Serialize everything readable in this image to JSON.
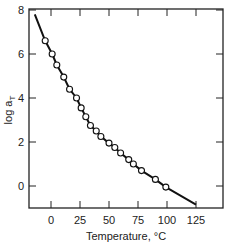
{
  "chart_data": {
    "type": "line",
    "title": "",
    "xlabel": "Temperature, °C",
    "ylabel": "log a",
    "ylabel_subscript": "T",
    "xlim": [
      -19,
      148
    ],
    "ylim": [
      -1,
      8
    ],
    "xticks": [
      0,
      25,
      50,
      75,
      100,
      125
    ],
    "yticks": [
      0,
      2,
      4,
      6,
      8
    ],
    "grid": false,
    "legend": null,
    "series": [
      {
        "name": "fitted curve",
        "style": "solid line",
        "x": [
          -14,
          -5,
          1,
          5,
          11,
          16,
          22,
          26,
          30,
          34,
          39,
          43,
          50,
          55,
          60,
          67,
          71,
          78,
          90,
          99,
          125
        ],
        "y": [
          7.8,
          6.6,
          6.0,
          5.5,
          4.95,
          4.4,
          4.0,
          3.55,
          3.15,
          2.75,
          2.5,
          2.25,
          1.95,
          1.75,
          1.5,
          1.2,
          1.0,
          0.7,
          0.3,
          -0.05,
          -0.85
        ]
      },
      {
        "name": "measured shift factors",
        "style": "open circles",
        "x": [
          -5,
          1,
          5,
          11,
          16,
          22,
          26,
          30,
          34,
          39,
          43,
          50,
          55,
          60,
          67,
          71,
          78,
          90,
          99
        ],
        "y": [
          6.6,
          6.0,
          5.5,
          4.95,
          4.4,
          4.0,
          3.55,
          3.15,
          2.75,
          2.5,
          2.25,
          1.95,
          1.75,
          1.5,
          1.2,
          1.0,
          0.7,
          0.3,
          -0.05
        ]
      }
    ]
  },
  "colors": {
    "line": "#111111",
    "marker_fill": "#ffffff",
    "frame": "#222222"
  }
}
